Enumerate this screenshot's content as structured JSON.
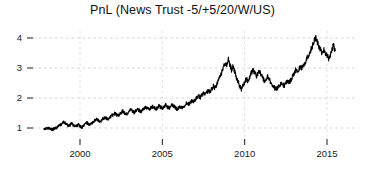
{
  "chart_data": {
    "type": "line",
    "title": "PnL (News Trust -5/+5/20/W/US)",
    "xlabel": "",
    "ylabel": "",
    "xlim": [
      1997.6,
      2015.9
    ],
    "ylim": [
      0.72,
      4.25
    ],
    "grid": true,
    "legend": null,
    "xticks": [
      2000,
      2005,
      2010,
      2015
    ],
    "xtick_labels": [
      "2000",
      "2005",
      "2010",
      "2015"
    ],
    "yticks": [
      1,
      2,
      3,
      4
    ],
    "ytick_labels": [
      "1",
      "2",
      "3",
      "4"
    ],
    "line_color": "#000000",
    "line_width": 1.1,
    "series": [
      {
        "name": "PnL",
        "x": [
          1997.8,
          1997.9,
          1998.0,
          1998.1,
          1998.2,
          1998.3,
          1998.4,
          1998.5,
          1998.6,
          1998.7,
          1998.8,
          1998.9,
          1999.0,
          1999.1,
          1999.2,
          1999.3,
          1999.4,
          1999.5,
          1999.6,
          1999.7,
          1999.8,
          1999.9,
          2000.0,
          2000.1,
          2000.2,
          2000.3,
          2000.4,
          2000.5,
          2000.6,
          2000.7,
          2000.8,
          2000.9,
          2001.0,
          2001.1,
          2001.2,
          2001.3,
          2001.4,
          2001.5,
          2001.6,
          2001.7,
          2001.8,
          2001.9,
          2002.0,
          2002.1,
          2002.2,
          2002.3,
          2002.4,
          2002.5,
          2002.6,
          2002.7,
          2002.8,
          2002.9,
          2003.0,
          2003.1,
          2003.2,
          2003.3,
          2003.4,
          2003.5,
          2003.6,
          2003.7,
          2003.8,
          2003.9,
          2004.0,
          2004.1,
          2004.2,
          2004.3,
          2004.4,
          2004.5,
          2004.6,
          2004.7,
          2004.8,
          2004.9,
          2005.0,
          2005.1,
          2005.2,
          2005.3,
          2005.4,
          2005.5,
          2005.6,
          2005.7,
          2005.8,
          2005.9,
          2006.0,
          2006.1,
          2006.2,
          2006.3,
          2006.4,
          2006.5,
          2006.6,
          2006.7,
          2006.8,
          2006.9,
          2007.0,
          2007.1,
          2007.2,
          2007.3,
          2007.4,
          2007.5,
          2007.6,
          2007.7,
          2007.8,
          2007.9,
          2008.0,
          2008.1,
          2008.2,
          2008.3,
          2008.4,
          2008.5,
          2008.6,
          2008.7,
          2008.8,
          2008.9,
          2009.0,
          2009.1,
          2009.2,
          2009.3,
          2009.4,
          2009.5,
          2009.6,
          2009.7,
          2009.8,
          2009.9,
          2010.0,
          2010.1,
          2010.2,
          2010.3,
          2010.4,
          2010.5,
          2010.6,
          2010.7,
          2010.8,
          2010.9,
          2011.0,
          2011.1,
          2011.2,
          2011.3,
          2011.4,
          2011.5,
          2011.6,
          2011.7,
          2011.8,
          2011.9,
          2012.0,
          2012.1,
          2012.2,
          2012.3,
          2012.4,
          2012.5,
          2012.6,
          2012.7,
          2012.8,
          2012.9,
          2013.0,
          2013.1,
          2013.2,
          2013.3,
          2013.4,
          2013.5,
          2013.6,
          2013.7,
          2013.8,
          2013.9,
          2014.0,
          2014.1,
          2014.2,
          2014.3,
          2014.4,
          2014.5,
          2014.6,
          2014.7,
          2014.8,
          2014.9,
          2015.0,
          2015.1,
          2015.2,
          2015.3,
          2015.4,
          2015.5
        ],
        "y": [
          1.0,
          0.98,
          0.97,
          0.99,
          0.96,
          0.95,
          0.97,
          1.0,
          1.02,
          1.06,
          1.1,
          1.14,
          1.2,
          1.17,
          1.12,
          1.07,
          1.11,
          1.15,
          1.09,
          1.05,
          1.08,
          1.12,
          1.06,
          1.02,
          1.06,
          1.12,
          1.18,
          1.14,
          1.1,
          1.15,
          1.2,
          1.25,
          1.3,
          1.26,
          1.21,
          1.25,
          1.31,
          1.36,
          1.33,
          1.29,
          1.34,
          1.4,
          1.44,
          1.49,
          1.45,
          1.41,
          1.46,
          1.52,
          1.56,
          1.5,
          1.45,
          1.5,
          1.56,
          1.61,
          1.55,
          1.51,
          1.57,
          1.63,
          1.58,
          1.53,
          1.6,
          1.66,
          1.71,
          1.66,
          1.6,
          1.66,
          1.72,
          1.68,
          1.62,
          1.68,
          1.74,
          1.7,
          1.65,
          1.7,
          1.76,
          1.71,
          1.66,
          1.71,
          1.77,
          1.73,
          1.68,
          1.63,
          1.67,
          1.72,
          1.68,
          1.73,
          1.79,
          1.84,
          1.8,
          1.86,
          1.92,
          1.88,
          1.94,
          2.0,
          2.07,
          2.02,
          2.09,
          2.16,
          2.11,
          2.18,
          2.26,
          2.21,
          2.3,
          2.4,
          2.33,
          2.44,
          2.56,
          2.7,
          2.85,
          3.0,
          3.18,
          3.05,
          3.3,
          3.12,
          2.95,
          3.05,
          2.88,
          2.7,
          2.55,
          2.4,
          2.3,
          2.4,
          2.52,
          2.64,
          2.56,
          2.7,
          2.84,
          2.95,
          2.84,
          2.72,
          2.8,
          2.9,
          2.8,
          2.66,
          2.55,
          2.62,
          2.7,
          2.6,
          2.5,
          2.42,
          2.35,
          2.3,
          2.34,
          2.42,
          2.5,
          2.45,
          2.4,
          2.48,
          2.58,
          2.52,
          2.6,
          2.7,
          2.82,
          2.94,
          2.88,
          2.96,
          3.06,
          3.0,
          3.1,
          3.22,
          3.34,
          3.46,
          3.58,
          3.7,
          3.88,
          4.02,
          3.88,
          3.72,
          3.6,
          3.5,
          3.62,
          3.52,
          3.42,
          3.32,
          3.45,
          3.6,
          3.78,
          3.58
        ]
      }
    ]
  }
}
